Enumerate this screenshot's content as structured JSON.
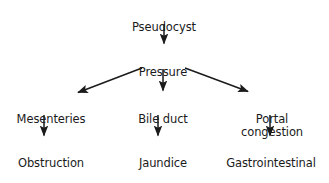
{
  "diagram": {
    "type": "flowchart",
    "background_color": "#ffffff",
    "text_color": "#1b1b1b",
    "arrow_color": "#1b1b1b",
    "nodes": [
      {
        "id": "pseudocyst",
        "label": "Pseudocyst",
        "level": 0,
        "column": "center",
        "cx": 164,
        "cy": 7,
        "lines": [
          "Pseudocyst"
        ]
      },
      {
        "id": "pressure",
        "label": "Pressure",
        "level": 1,
        "column": "center",
        "cx": 163,
        "cy": 52,
        "lines": [
          "Pressure"
        ]
      },
      {
        "id": "mesenteries",
        "label": "Mesenteries",
        "level": 2,
        "column": "left",
        "cx": 51,
        "cy": 99,
        "lines": [
          "Mesenteries"
        ]
      },
      {
        "id": "bile-duct",
        "label": "Bile duct",
        "level": 2,
        "column": "center",
        "cx": 163,
        "cy": 99,
        "lines": [
          "Bile duct"
        ]
      },
      {
        "id": "portal-congestion",
        "label": "Portal congestion",
        "level": 2,
        "column": "right",
        "cx": 272,
        "cy": 99,
        "lines": [
          "Portal congestion"
        ]
      },
      {
        "id": "obstruction",
        "label": "Obstruction",
        "level": 3,
        "column": "left",
        "cx": 51,
        "cy": 143,
        "lines": [
          "Obstruction"
        ]
      },
      {
        "id": "jaundice",
        "label": "Jaundice",
        "level": 3,
        "column": "center",
        "cx": 163,
        "cy": 143,
        "lines": [
          "Jaundice"
        ]
      },
      {
        "id": "gi-haemorrhage",
        "label": "Gastrointestinal haemorrhage",
        "level": 3,
        "column": "right",
        "cx": 271,
        "cy": 143,
        "lines": [
          "Gastrointestinal",
          "haemorrhage"
        ]
      }
    ],
    "edges": [
      {
        "id": "edge-pseudocyst-pressure",
        "from": "pseudocyst",
        "to": "pressure",
        "kind": "vertical"
      },
      {
        "id": "edge-pressure-mesenteries",
        "from": "pressure",
        "to": "mesenteries",
        "kind": "diagonal-left"
      },
      {
        "id": "edge-pressure-bile-duct",
        "from": "pressure",
        "to": "bile-duct",
        "kind": "vertical"
      },
      {
        "id": "edge-pressure-portal-congestion",
        "from": "pressure",
        "to": "portal-congestion",
        "kind": "diagonal-right"
      },
      {
        "id": "edge-mesenteries-obstruction",
        "from": "mesenteries",
        "to": "obstruction",
        "kind": "vertical"
      },
      {
        "id": "edge-bile-duct-jaundice",
        "from": "bile-duct",
        "to": "jaundice",
        "kind": "vertical"
      },
      {
        "id": "edge-portal-congestion-gi",
        "from": "portal-congestion",
        "to": "gi-haemorrhage",
        "kind": "vertical"
      }
    ]
  }
}
